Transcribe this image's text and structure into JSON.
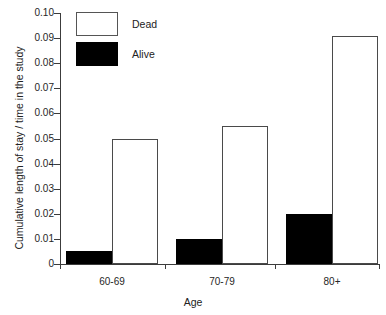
{
  "top_caption": "",
  "chart_data": {
    "type": "bar",
    "title": "",
    "xlabel": "Age",
    "ylabel": "Cumulative length of stay / time in the study",
    "categories": [
      "60-69",
      "70-79",
      "80+"
    ],
    "series": [
      {
        "name": "Alive",
        "color": "#000000",
        "fill": "solid-black",
        "values": [
          0.005,
          0.01,
          0.02
        ]
      },
      {
        "name": "Dead",
        "color": "#ffffff",
        "fill": "white-outline",
        "values": [
          0.05,
          0.055,
          0.091
        ]
      }
    ],
    "series_order_in_group": [
      "Alive",
      "Dead"
    ],
    "ylim": [
      0,
      0.1
    ],
    "ytick_values": [
      0,
      0.01,
      0.02,
      0.03,
      0.04,
      0.05,
      0.06,
      0.07,
      0.08,
      0.09,
      0.1
    ],
    "ytick_labels": [
      "0",
      "0.01",
      "0.02",
      "0.03",
      "0.04",
      "0.05",
      "0.06",
      "0.07",
      "0.08",
      "0.09",
      "0.10"
    ],
    "grid": false,
    "legend_position": "top-left-inside",
    "legend_entries": [
      {
        "label": "Dead",
        "swatch": "white-outline"
      },
      {
        "label": "Alive",
        "swatch": "solid-black"
      }
    ]
  }
}
